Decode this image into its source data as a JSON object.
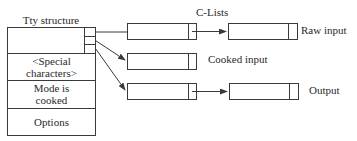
{
  "diagram": {
    "tty_structure": {
      "title": "Tty structure",
      "fields": [
        {
          "line1": "<Special",
          "line2": "characters>"
        },
        {
          "line1": "Mode is",
          "line2": "cooked"
        },
        {
          "line1": "Options",
          "line2": ""
        }
      ]
    },
    "clists_label": "C-Lists",
    "queues": [
      {
        "label": "Raw input",
        "has_next": true
      },
      {
        "label": "Cooked input",
        "has_next": false
      },
      {
        "label": "Output",
        "has_next": true
      }
    ],
    "colors": {
      "stroke": "#3a3a3a",
      "text": "#2a2a2a",
      "background": "#ffffff"
    }
  }
}
